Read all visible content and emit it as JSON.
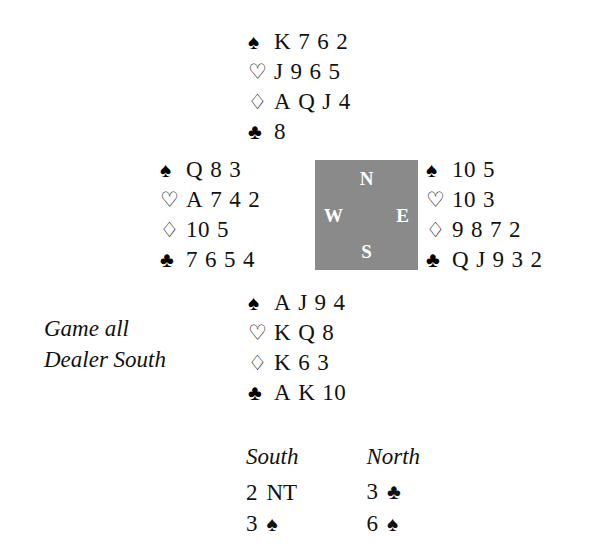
{
  "suit_symbols": {
    "spades": "♠",
    "hearts": "♡",
    "diamonds": "♢",
    "clubs": "♣"
  },
  "hands": {
    "north": {
      "label": "North",
      "spades": "K 7 6 2",
      "hearts": "J 9 6 5",
      "diamonds": "A Q J 4",
      "clubs": "8"
    },
    "west": {
      "label": "West",
      "spades": "Q 8 3",
      "hearts": "A 7 4 2",
      "diamonds": "10 5",
      "clubs": "7 6 5 4"
    },
    "east": {
      "label": "East",
      "spades": "10 5",
      "hearts": "10 3",
      "diamonds": "9 8 7 2",
      "clubs": "Q J 9 3 2"
    },
    "south": {
      "label": "South",
      "spades": "A J 9 4",
      "hearts": "K Q 8",
      "diamonds": "K 6 3",
      "clubs": "A K 10"
    }
  },
  "compass": {
    "north": "N",
    "south": "S",
    "west": "W",
    "east": "E",
    "box_color": "#8a8a8a",
    "letter_color": "#ffffff"
  },
  "conditions": {
    "vulnerability": "Game all",
    "dealer": "Dealer South"
  },
  "auction": {
    "headers": [
      "South",
      "North"
    ],
    "rows": [
      {
        "south_level": "2",
        "south_strain": "NT",
        "north_level": "3",
        "north_strain": "♣"
      },
      {
        "south_level": "3",
        "south_strain": "♠",
        "north_level": "6",
        "north_strain": "♠"
      }
    ]
  }
}
